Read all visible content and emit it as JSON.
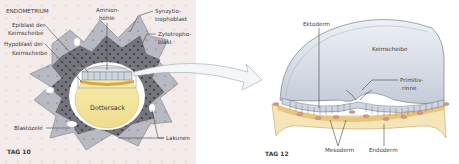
{
  "figure": {
    "left_panel": {
      "stage_label": "TAG 10",
      "region_label": "ENDOMETRIUM",
      "labels": {
        "epiblast": [
          "Epiblast der",
          "Keimscheibe"
        ],
        "hypoblast": [
          "Hypoblast der",
          "Keimscheibe"
        ],
        "amnion": [
          "Amnion-",
          "höhle"
        ],
        "synzytio": [
          "Synzytio-",
          "trophoblast"
        ],
        "zytotropho": [
          "Zytotropho-",
          "blast"
        ],
        "dottersack": "Dottersack",
        "blastozele": "Blastozele",
        "lakunen": "Lakunen"
      }
    },
    "right_panel": {
      "stage_label": "TAG 12",
      "labels": {
        "ektoderm": "Ektoderm",
        "keimscheibe": "Keimscheibe",
        "primitivrinne": [
          "Primitiv-",
          "rinne"
        ],
        "mesoderm": "Mesoderm",
        "endoderm": "Endoderm"
      }
    },
    "colors": {
      "endometrium_bg": "#f3ebe9",
      "synzytio": "#b9b9c3",
      "zytotropho": "#77777f",
      "dottersack": "#f4e59d",
      "keimscheibe": "#d9dfe8",
      "endoderm_layer": "#e8c47c",
      "mesoderm_cells": "#d99a8c"
    }
  }
}
